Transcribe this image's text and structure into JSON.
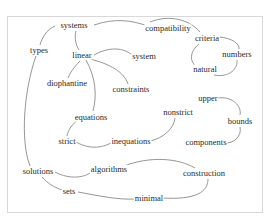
{
  "diagram": {
    "type": "word-association-graph",
    "nodes": [
      {
        "id": "systems",
        "label": "systems",
        "x": 74,
        "y": 25
      },
      {
        "id": "compatibility",
        "label": "compatibility",
        "x": 168,
        "y": 28
      },
      {
        "id": "types",
        "label": "types",
        "x": 39,
        "y": 50
      },
      {
        "id": "linear",
        "label": "linear",
        "x": 82,
        "y": 55
      },
      {
        "id": "system",
        "label": "system",
        "x": 144,
        "y": 56
      },
      {
        "id": "criteria",
        "label": "criteria",
        "x": 207,
        "y": 38
      },
      {
        "id": "numbers",
        "label": "numbers",
        "x": 237,
        "y": 54
      },
      {
        "id": "natural",
        "label": "natural",
        "x": 205,
        "y": 69
      },
      {
        "id": "diophantine",
        "label": "diophantine",
        "x": 67,
        "y": 83
      },
      {
        "id": "constraints",
        "label": "constraints",
        "x": 131,
        "y": 89
      },
      {
        "id": "upper",
        "label": "upper",
        "x": 208,
        "y": 98
      },
      {
        "id": "bounds",
        "label": "bounds",
        "x": 240,
        "y": 121
      },
      {
        "id": "nonstrict",
        "label": "nonstrict",
        "x": 178,
        "y": 112
      },
      {
        "id": "equations",
        "label": "equations",
        "x": 91,
        "y": 117
      },
      {
        "id": "strict",
        "label": "strict",
        "x": 67,
        "y": 141
      },
      {
        "id": "inequations",
        "label": "inequations",
        "x": 131,
        "y": 141
      },
      {
        "id": "components",
        "label": "components",
        "x": 206,
        "y": 142
      },
      {
        "id": "algorithms",
        "label": "algorithms",
        "x": 109,
        "y": 169
      },
      {
        "id": "solutions",
        "label": "solutions",
        "x": 38,
        "y": 171
      },
      {
        "id": "construction",
        "label": "construction",
        "x": 204,
        "y": 173
      },
      {
        "id": "sets",
        "label": "sets",
        "x": 69,
        "y": 191
      },
      {
        "id": "minimal",
        "label": "minimal",
        "x": 149,
        "y": 198
      }
    ],
    "edges": [
      {
        "from": "systems",
        "to": "compatibility"
      },
      {
        "from": "compatibility",
        "to": "criteria"
      },
      {
        "from": "systems",
        "to": "types"
      },
      {
        "from": "systems",
        "to": "linear"
      },
      {
        "from": "linear",
        "to": "system"
      },
      {
        "from": "linear",
        "to": "diophantine"
      },
      {
        "from": "linear",
        "to": "constraints"
      },
      {
        "from": "linear",
        "to": "equations"
      },
      {
        "from": "criteria",
        "to": "numbers"
      },
      {
        "from": "criteria",
        "to": "natural"
      },
      {
        "from": "natural",
        "to": "numbers"
      },
      {
        "from": "upper",
        "to": "bounds"
      },
      {
        "from": "bounds",
        "to": "components"
      },
      {
        "from": "equations",
        "to": "strict"
      },
      {
        "from": "strict",
        "to": "inequations"
      },
      {
        "from": "inequations",
        "to": "nonstrict"
      },
      {
        "from": "types",
        "to": "solutions"
      },
      {
        "from": "solutions",
        "to": "algorithms"
      },
      {
        "from": "solutions",
        "to": "sets"
      },
      {
        "from": "algorithms",
        "to": "construction"
      },
      {
        "from": "construction",
        "to": "minimal"
      },
      {
        "from": "sets",
        "to": "minimal"
      }
    ],
    "colors": {
      "text": "#2a2a2a",
      "edge": "#8a8a8a",
      "frame": "#d8d8d8",
      "background": "#ffffff"
    }
  }
}
